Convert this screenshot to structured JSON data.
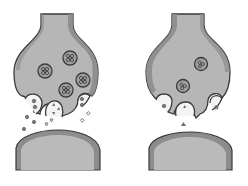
{
  "figure": {
    "colors": {
      "background": "#ffffff",
      "terminal_fill": "#b4b4b4",
      "terminal_shade": "#8c8c8c",
      "outline": "#3a3a3a",
      "vesicle_fill": "#9a9a9a",
      "pocket_fill": "#f4f4f4",
      "molecule": "#6a6a6a"
    },
    "panels": [
      {
        "id": "left-synapse",
        "vesicles_in_terminal": 4,
        "fusing_vesicles": 3,
        "released_molecules": "many"
      },
      {
        "id": "right-synapse",
        "vesicles_in_terminal": 2,
        "fusing_vesicles": 3,
        "released_molecules": "one"
      }
    ]
  }
}
